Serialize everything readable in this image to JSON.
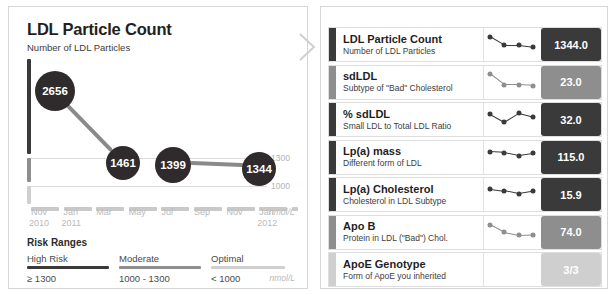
{
  "left_panel": {
    "title": "LDL Particle Count",
    "subtitle": "Number of LDL Particles",
    "units": "nmol/L",
    "risk_section": {
      "heading": "Risk Ranges",
      "units": "nmol/L",
      "ranges": [
        {
          "name": "High Risk",
          "value": "≥ 1300",
          "color": "#3a3a3a"
        },
        {
          "name": "Moderate",
          "value": "1000 - 1300",
          "color": "#8e8e8e"
        },
        {
          "name": "Optimal",
          "value": "< 1000",
          "color": "#cfcfcf"
        }
      ]
    }
  },
  "chart_data": {
    "type": "line",
    "title": "LDL Particle Count",
    "subtitle": "Number of LDL Particles",
    "xlabel": "",
    "ylabel": "nmol/L",
    "units": "nmol/L",
    "grid": true,
    "legend": false,
    "ylim": [
      0,
      2900
    ],
    "gridlines": [
      {
        "value": 1300,
        "label": "1300"
      },
      {
        "value": 1000,
        "label": "1000"
      }
    ],
    "x_tick_labels": [
      {
        "month": "Nov",
        "year": "2010"
      },
      {
        "month": "Jan",
        "year": "2011"
      },
      {
        "month": "Mar",
        "year": ""
      },
      {
        "month": "May",
        "year": ""
      },
      {
        "month": "Jul",
        "year": ""
      },
      {
        "month": "Sep",
        "year": ""
      },
      {
        "month": "Nov",
        "year": ""
      },
      {
        "month": "Jan",
        "year": "2012"
      }
    ],
    "points": [
      {
        "label": "2656",
        "value": 2656,
        "x_index": 0
      },
      {
        "label": "1461",
        "value": 1461,
        "x_index": 3
      },
      {
        "label": "1399",
        "value": 1399,
        "x_index": 4
      },
      {
        "label": "1344",
        "value": 1344,
        "x_index": 7
      }
    ],
    "axis_segments": [
      {
        "name": "High Risk",
        "color": "#3a3a3a"
      },
      {
        "name": "Moderate",
        "color": "#8e8e8e"
      },
      {
        "name": "Optimal",
        "color": "#cfcfcf"
      }
    ]
  },
  "right_panel": {
    "rows": [
      {
        "name": "LDL Particle Count",
        "desc": "Number of LDL Particles",
        "value": "1344.0",
        "bar_color": "#3a3a3a",
        "value_bg": "#3a3a3a",
        "dot_color": "#3a3a3a",
        "spark": [
          0.18,
          0.58,
          0.58,
          0.66
        ]
      },
      {
        "name": "sdLDL",
        "desc": "Subtype of \"Bad\" Cholesterol",
        "value": "23.0",
        "bar_color": "#8e8e8e",
        "value_bg": "#8e8e8e",
        "dot_color": "#8e8e8e",
        "spark": [
          0.16,
          0.68,
          0.68,
          0.72
        ]
      },
      {
        "name": "% sdLDL",
        "desc": "Small LDL to Total LDL Ratio",
        "value": "32.0",
        "bar_color": "#3a3a3a",
        "value_bg": "#3a3a3a",
        "dot_color": "#3a3a3a",
        "spark": [
          0.3,
          0.68,
          0.26,
          0.44
        ]
      },
      {
        "name": "Lp(a) mass",
        "desc": "Different form of LDL",
        "value": "115.0",
        "bar_color": "#3a3a3a",
        "value_bg": "#3a3a3a",
        "dot_color": "#3a3a3a",
        "spark": [
          0.3,
          0.34,
          0.48,
          0.38
        ]
      },
      {
        "name": "Lp(a) Cholesterol",
        "desc": "Cholesterol in LDL Subtype",
        "value": "15.9",
        "bar_color": "#3a3a3a",
        "value_bg": "#3a3a3a",
        "dot_color": "#3a3a3a",
        "spark": [
          0.3,
          0.38,
          0.52,
          0.4
        ]
      },
      {
        "name": "Apo B",
        "desc": "Protein in LDL (\"Bad\") Chol.",
        "value": "74.0",
        "bar_color": "#8e8e8e",
        "value_bg": "#8e8e8e",
        "dot_color": "#8e8e8e",
        "spark": [
          0.2,
          0.56,
          0.7,
          0.68
        ]
      },
      {
        "name": "ApoE Genotype",
        "desc": "Form of ApoE you inherited",
        "value": "3/3",
        "bar_color": "#cfcfcf",
        "value_bg": "#cfcfcf",
        "dot_color": "#cfcfcf",
        "spark": []
      }
    ]
  }
}
